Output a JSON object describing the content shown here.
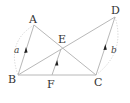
{
  "diagram": {
    "points": [
      {
        "name": "A",
        "x": 34,
        "y": 25,
        "label_x": 29,
        "label_y": 23
      },
      {
        "name": "B",
        "x": 18,
        "y": 75,
        "label_x": 8,
        "label_y": 83
      },
      {
        "name": "C",
        "x": 96,
        "y": 75,
        "label_x": 94,
        "label_y": 86
      },
      {
        "name": "D",
        "x": 115,
        "y": 17,
        "label_x": 111,
        "label_y": 14
      },
      {
        "name": "E",
        "x": 61,
        "y": 49,
        "label_x": 58,
        "label_y": 43
      },
      {
        "name": "F",
        "x": 52,
        "y": 75,
        "label_x": 47,
        "label_y": 88
      }
    ],
    "segments": [
      {
        "from": "A",
        "to": "B"
      },
      {
        "from": "A",
        "to": "C"
      },
      {
        "from": "B",
        "to": "D"
      },
      {
        "from": "B",
        "to": "C"
      },
      {
        "from": "F",
        "to": "E"
      },
      {
        "from": "C",
        "to": "D"
      }
    ],
    "arcs": [
      {
        "label": "a",
        "between": [
          "A",
          "B"
        ],
        "label_x": 14,
        "label_y": 53
      },
      {
        "label": "b",
        "between": [
          "D",
          "C"
        ],
        "label_x": 111,
        "label_y": 53
      }
    ],
    "arrows_on": [
      "A-B",
      "F-E",
      "C-D"
    ],
    "labels": {
      "A": "A",
      "B": "B",
      "C": "C",
      "D": "D",
      "E": "E",
      "F": "F",
      "a": "a",
      "b": "b"
    }
  }
}
